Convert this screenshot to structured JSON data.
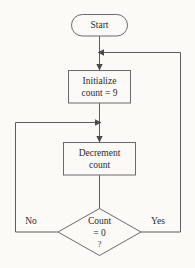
{
  "diagram": {
    "type": "flowchart",
    "title": "",
    "background_color": "#fbfaf7",
    "line_color": "#5d5d5d",
    "text_color": "#2b2b2b",
    "nodes": [
      {
        "id": "start",
        "shape": "terminator",
        "label": "Start"
      },
      {
        "id": "initialize",
        "shape": "process",
        "line1": "Initialize",
        "line2": "count = 9"
      },
      {
        "id": "decrement",
        "shape": "process",
        "line1": "Decrement",
        "line2": "count"
      },
      {
        "id": "decision",
        "shape": "decision",
        "line1": "Count",
        "line2": "= 0",
        "line3": "?"
      }
    ],
    "branches": {
      "no_label": "No",
      "yes_label": "Yes"
    }
  }
}
